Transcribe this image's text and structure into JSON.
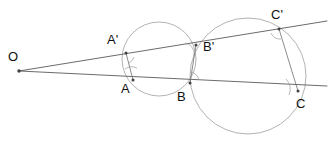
{
  "figure": {
    "type": "geometry-diagram",
    "width": 332,
    "height": 141,
    "background_color": "#ffffff"
  },
  "colors": {
    "circle_stroke": "#a0a0a0",
    "line_stroke": "#5a5a5a",
    "chord_stroke": "#6e6e6e",
    "angle_arc_stroke": "#9a9a9a",
    "point_fill": "#404040",
    "label_color": "#101010"
  },
  "strokes": {
    "circle_width": 0.8,
    "line_width": 0.9,
    "chord_width": 0.8,
    "angle_arc_width": 0.7
  },
  "labels": [
    {
      "id": "O",
      "text": "O",
      "x": 8,
      "y": 50
    },
    {
      "id": "Ap",
      "text": "A'",
      "x": 107,
      "y": 33
    },
    {
      "id": "A",
      "text": "A",
      "x": 121,
      "y": 82
    },
    {
      "id": "Bp",
      "text": "B'",
      "x": 203,
      "y": 40
    },
    {
      "id": "B",
      "text": "B",
      "x": 177,
      "y": 90
    },
    {
      "id": "Cp",
      "text": "C'",
      "x": 271,
      "y": 8
    },
    {
      "id": "C",
      "text": "C",
      "x": 296,
      "y": 97
    }
  ],
  "points": [
    {
      "id": "O",
      "name": "external-point-o",
      "x": 19,
      "y": 71,
      "r": 1.7
    },
    {
      "id": "Ap",
      "name": "point-a-prime",
      "x": 126,
      "y": 53,
      "r": 1.5
    },
    {
      "id": "A",
      "name": "point-a",
      "x": 133,
      "y": 80,
      "r": 1.5
    },
    {
      "id": "Bp",
      "name": "point-b-prime",
      "x": 196,
      "y": 45,
      "r": 1.5
    },
    {
      "id": "B",
      "name": "point-b",
      "x": 190,
      "y": 83,
      "r": 1.5
    },
    {
      "id": "Cp",
      "name": "point-c-prime",
      "x": 279,
      "y": 29,
      "r": 1.5
    },
    {
      "id": "C",
      "name": "point-c",
      "x": 298,
      "y": 91,
      "r": 1.5
    }
  ],
  "circles": [
    {
      "id": "circle1",
      "name": "circle-through-a-a-prime-b-b-prime",
      "cx": 159,
      "cy": 59,
      "r": 37
    },
    {
      "id": "circle2",
      "name": "circle-through-b-b-prime-c-c-prime",
      "cx": 248,
      "cy": 76,
      "r": 58
    }
  ],
  "lines": [
    {
      "id": "upper-secant",
      "name": "upper-secant-line-o-a-prime-b-prime-c-prime",
      "x1": 19,
      "y1": 71,
      "x2": 327,
      "y2": 21
    },
    {
      "id": "lower-secant",
      "name": "lower-secant-line-o-a-b-c",
      "x1": 19,
      "y1": 71,
      "x2": 327,
      "y2": 86
    }
  ],
  "chords": [
    {
      "id": "chord-aa",
      "name": "chord-a-to-a-prime",
      "x1": 126,
      "y1": 53,
      "x2": 133,
      "y2": 80
    },
    {
      "id": "chord-bb",
      "name": "chord-b-to-b-prime",
      "x1": 196,
      "y1": 45,
      "x2": 190,
      "y2": 83
    },
    {
      "id": "chord-cc",
      "name": "chord-c-to-c-prime",
      "x1": 279,
      "y1": 29,
      "x2": 298,
      "y2": 91
    }
  ],
  "angle_arcs": [
    {
      "id": "angle-a",
      "name": "angle-mark-at-a",
      "d": "M 125 69 A 12 12 0 0 1 137 68"
    },
    {
      "id": "angle-ap",
      "name": "angle-mark-at-a-prime",
      "d": "M 134 57 A 10 10 0 0 1 129 63"
    },
    {
      "id": "angle-bp",
      "name": "angle-mark-at-b-prime",
      "d": "M 185 43 A 11 11 0 0 1 194 56"
    },
    {
      "id": "angle-b",
      "name": "angle-mark-at-b",
      "d": "M 191 72 A 11 11 0 0 1 199 80"
    },
    {
      "id": "angle-c",
      "name": "angle-mark-at-c",
      "d": "M 286 79 A 14 14 0 0 1 289 95"
    },
    {
      "id": "angle-cp",
      "name": "angle-mark-at-c-prime",
      "d": "M 271 33 A 10 10 0 0 0 281 39"
    }
  ]
}
